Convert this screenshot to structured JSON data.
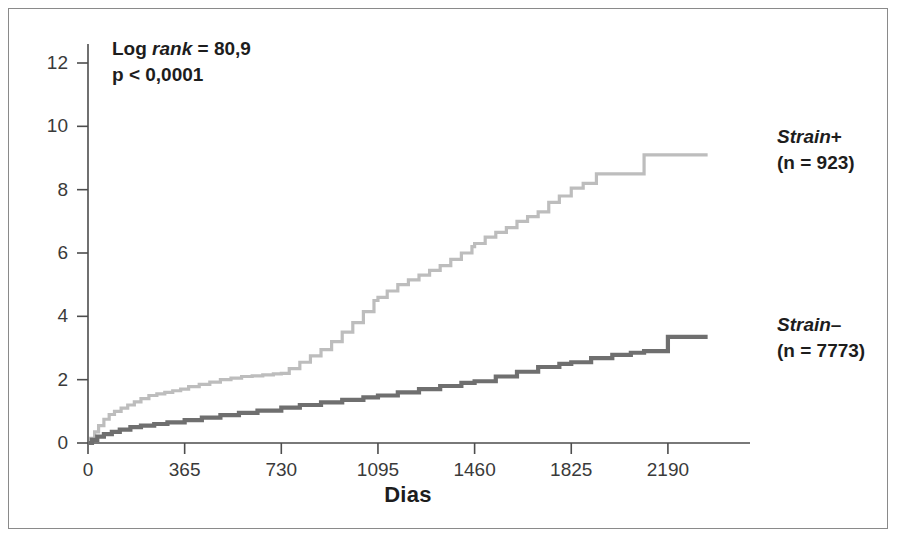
{
  "annotations": {
    "logrank_prefix": "Log ",
    "logrank_italic": "rank",
    "logrank_value": " = 80,9",
    "pvalue": "p < 0,0001"
  },
  "legend": {
    "position": "right",
    "entries": [
      {
        "name": "Strain",
        "sign": "+",
        "n_label": "(n = 923)",
        "n": 923,
        "color": "#bdbdbd"
      },
      {
        "name": "Strain",
        "sign": "–",
        "n_label": "(n = 7773)",
        "n": 7773,
        "color": "#6f6f6f"
      }
    ]
  },
  "chart_data": {
    "type": "line",
    "title": "",
    "subtitle": "",
    "xlabel": "Dias",
    "ylabel": "",
    "xlim": [
      0,
      2500
    ],
    "ylim": [
      0,
      12.6
    ],
    "grid": false,
    "legend_position": "right",
    "xticks": [
      0,
      365,
      730,
      1095,
      1460,
      1825,
      2190
    ],
    "xtick_labels": [
      "0",
      "365",
      "730",
      "1095",
      "1460",
      "1825",
      "2190"
    ],
    "yticks": [
      0,
      2,
      4,
      6,
      8,
      10,
      12
    ],
    "ytick_labels": [
      "0",
      "2",
      "4",
      "6",
      "8",
      "10",
      "12"
    ],
    "series": [
      {
        "name": "Strain +",
        "color": "#bdbdbd",
        "style": "step",
        "x": [
          0,
          10,
          25,
          40,
          60,
          80,
          100,
          125,
          150,
          175,
          200,
          230,
          260,
          290,
          320,
          350,
          380,
          420,
          460,
          500,
          540,
          580,
          620,
          660,
          700,
          730,
          760,
          800,
          840,
          880,
          920,
          960,
          1000,
          1040,
          1080,
          1095,
          1130,
          1170,
          1210,
          1250,
          1290,
          1330,
          1370,
          1410,
          1450,
          1460,
          1500,
          1540,
          1580,
          1620,
          1660,
          1700,
          1740,
          1780,
          1825,
          1870,
          1920,
          1970,
          2020,
          2070,
          2100,
          2190,
          2280,
          2340
        ],
        "y": [
          0,
          0.15,
          0.35,
          0.55,
          0.75,
          0.9,
          1.0,
          1.1,
          1.2,
          1.3,
          1.4,
          1.5,
          1.55,
          1.6,
          1.65,
          1.7,
          1.78,
          1.85,
          1.92,
          2.0,
          2.05,
          2.1,
          2.12,
          2.15,
          2.18,
          2.2,
          2.35,
          2.55,
          2.75,
          2.95,
          3.2,
          3.5,
          3.8,
          4.15,
          4.5,
          4.6,
          4.8,
          5.0,
          5.15,
          5.3,
          5.45,
          5.6,
          5.8,
          6.0,
          6.2,
          6.3,
          6.5,
          6.65,
          6.8,
          7.0,
          7.15,
          7.3,
          7.6,
          7.8,
          8.05,
          8.2,
          8.5,
          8.5,
          8.5,
          8.5,
          9.1,
          9.1,
          9.1,
          9.1
        ]
      },
      {
        "name": "Strain –",
        "color": "#6f6f6f",
        "style": "step",
        "x": [
          0,
          15,
          35,
          60,
          90,
          120,
          160,
          200,
          250,
          300,
          365,
          430,
          500,
          570,
          640,
          730,
          800,
          880,
          960,
          1040,
          1095,
          1170,
          1250,
          1330,
          1410,
          1460,
          1540,
          1620,
          1700,
          1780,
          1825,
          1900,
          1980,
          2050,
          2100,
          2190,
          2280,
          2340
        ],
        "y": [
          0,
          0.1,
          0.2,
          0.28,
          0.35,
          0.42,
          0.5,
          0.55,
          0.6,
          0.65,
          0.72,
          0.8,
          0.88,
          0.95,
          1.02,
          1.12,
          1.2,
          1.28,
          1.36,
          1.44,
          1.5,
          1.6,
          1.7,
          1.8,
          1.9,
          1.95,
          2.1,
          2.25,
          2.4,
          2.5,
          2.55,
          2.68,
          2.78,
          2.85,
          2.9,
          3.35,
          3.35,
          3.35
        ]
      }
    ]
  }
}
